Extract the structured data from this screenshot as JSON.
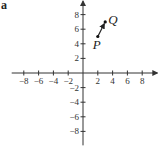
{
  "panel_label": "a",
  "chart_data": {
    "type": "scatter",
    "title": "",
    "xlabel": "",
    "ylabel": "",
    "xlim": [
      -9.5,
      9.5
    ],
    "ylim": [
      -9.5,
      9.5
    ],
    "grid": false,
    "legend": null,
    "x_ticks": [
      -8,
      -6,
      -4,
      -2,
      2,
      4,
      6,
      8
    ],
    "y_ticks": [
      -8,
      -6,
      -4,
      -2,
      2,
      4,
      6,
      8
    ],
    "x_tick_labels": [
      "−8",
      "−6",
      "−4",
      "−2",
      "2",
      "4",
      "6",
      "8"
    ],
    "y_tick_labels": [
      "−8",
      "−6",
      "−4",
      "−2",
      "2",
      "4",
      "6",
      "8"
    ],
    "points": [
      {
        "name": "P",
        "x": 2,
        "y": 5
      },
      {
        "name": "Q",
        "x": 3,
        "y": 7
      }
    ],
    "vectors": [
      {
        "from": "P",
        "to": "Q",
        "label": "PQ"
      }
    ]
  }
}
